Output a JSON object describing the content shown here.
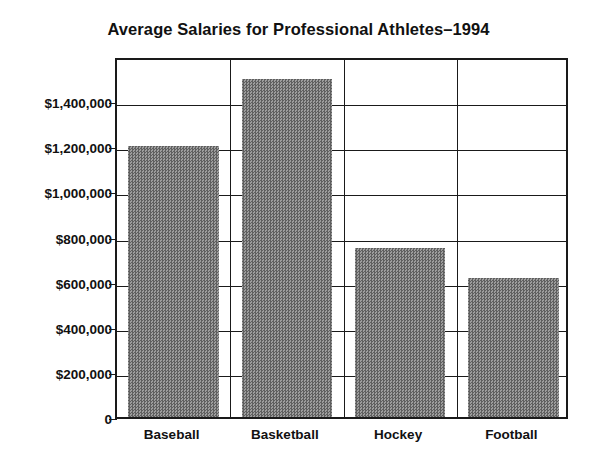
{
  "chart_data": {
    "type": "bar",
    "title": "Average Salaries for Professional Athletes–1994",
    "xlabel": "",
    "ylabel": "",
    "categories": [
      "Baseball",
      "Basketball",
      "Hockey",
      "Football"
    ],
    "values": [
      1200000,
      1500000,
      750000,
      615000
    ],
    "ylim": [
      0,
      1600000
    ],
    "ytick_values": [
      0,
      200000,
      400000,
      600000,
      800000,
      1000000,
      1200000,
      1400000
    ],
    "ytick_labels": [
      "0",
      "$200,000",
      "$400,000",
      "$600,000",
      "$800,000",
      "$1,000,000",
      "$1,200,000",
      "$1,400,000"
    ],
    "grid": true,
    "grid_orientation": "both",
    "legend": null,
    "legend_position": "none",
    "bar_color": "#7d7d7d",
    "axis_color": "#1a1a1a",
    "background_color": "#ffffff",
    "annotations": []
  }
}
